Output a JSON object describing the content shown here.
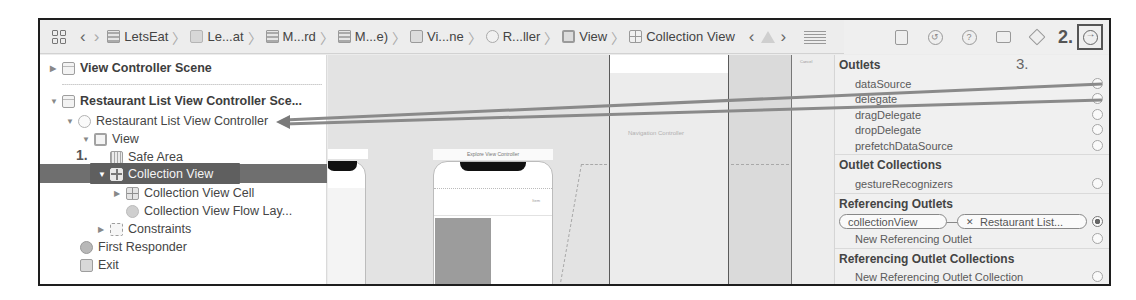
{
  "jump_bar": {
    "breadcrumbs": [
      {
        "label": "LetsEat",
        "icon": "project-icon"
      },
      {
        "label": "Le...at",
        "icon": "folder-icon"
      },
      {
        "label": "M...rd",
        "icon": "storyboard-file-icon"
      },
      {
        "label": "M...e)",
        "icon": "storyboard-file-icon"
      },
      {
        "label": "Vi...ne",
        "icon": "scene-icon"
      },
      {
        "label": "R...ller",
        "icon": "view-controller-icon"
      },
      {
        "label": "View",
        "icon": "view-icon"
      },
      {
        "label": "Collection View",
        "icon": "collection-view-icon"
      }
    ]
  },
  "inspector_tabs": {
    "step_label": "2.",
    "tabs": [
      "file-inspector",
      "history-inspector",
      "quick-help-inspector",
      "identity-inspector",
      "attributes-inspector",
      "connections-inspector"
    ],
    "selected": "connections-inspector"
  },
  "outline": {
    "step_label": "1.",
    "items": [
      {
        "label": "View Controller Scene",
        "bold": true
      },
      {
        "label": "Restaurant List View Controller Sce...",
        "bold": true
      },
      {
        "label": "Restaurant List View Controller"
      },
      {
        "label": "View"
      },
      {
        "label": "Safe Area"
      },
      {
        "label": "Collection View",
        "selected": true
      },
      {
        "label": "Collection View Cell"
      },
      {
        "label": "Collection View Flow Lay..."
      },
      {
        "label": "Constraints"
      },
      {
        "label": "First Responder"
      },
      {
        "label": "Exit"
      }
    ]
  },
  "canvas": {
    "explore_title": "Explore View Controller",
    "explore_tiny_label": "Item",
    "nav_controller_label": "Navigation Controller",
    "right_scene_label": "Cancel"
  },
  "connections": {
    "step_label": "3.",
    "outlets_title": "Outlets",
    "outlets": [
      "dataSource",
      "delegate",
      "dragDelegate",
      "dropDelegate",
      "prefetchDataSource"
    ],
    "outlet_collections_title": "Outlet Collections",
    "outlet_collections": [
      "gestureRecognizers"
    ],
    "referencing_outlets_title": "Referencing Outlets",
    "referencing_outlet": {
      "name": "collectionView",
      "target": "Restaurant List..."
    },
    "new_referencing_outlet": "New Referencing Outlet",
    "referencing_outlet_collections_title": "Referencing Outlet Collections",
    "new_referencing_outlet_collection": "New Referencing Outlet Collection"
  }
}
